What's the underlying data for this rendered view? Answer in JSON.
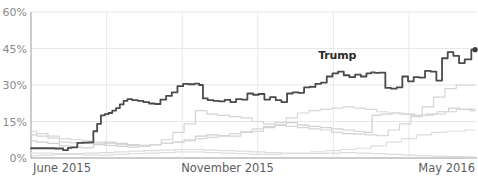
{
  "chart_data": {
    "type": "line",
    "title": "",
    "xlabel": "",
    "ylabel": "",
    "ylim": [
      0,
      60
    ],
    "yunit": "%",
    "grid": true,
    "legend_position": "inline-annotation",
    "ytick_labels": [
      "60%",
      "45%",
      "30%",
      "15%",
      "0%"
    ],
    "ytick_values": [
      60,
      45,
      30,
      15,
      0
    ],
    "xtick_labels": [
      "June 2015",
      "November 2015",
      "May 2016"
    ],
    "xtick_positions": [
      0,
      5.2,
      11.2
    ],
    "x_range_months": [
      0,
      11.8
    ],
    "annotations": [
      {
        "text": "Trump",
        "x_month": 8.1,
        "y_value": 40.5
      }
    ],
    "endpoint_marker": {
      "series": "Trump",
      "x_month": 11.75,
      "y_value": 44.5,
      "color": "#3d3d3d"
    },
    "colors": {
      "highlight_line": "#4a4a4a",
      "other_line": "#cfcfcf",
      "grid": "#e8e8e8",
      "axis": "#9a9a9a",
      "tick_text": "#8a8a8a",
      "xtick_text": "#5d5d5d",
      "background": "#ffffff"
    },
    "series": [
      {
        "name": "Trump",
        "highlight": true,
        "color": "#4a4a4a",
        "x": [
          0.0,
          0.25,
          0.5,
          0.75,
          0.95,
          1.0,
          1.15,
          1.3,
          1.45,
          1.6,
          1.7,
          1.8,
          1.9,
          2.0,
          2.1,
          2.2,
          2.3,
          2.4,
          2.5,
          2.6,
          2.75,
          2.9,
          3.05,
          3.2,
          3.35,
          3.5,
          3.65,
          3.8,
          3.95,
          4.1,
          4.25,
          4.4,
          4.5,
          4.6,
          4.75,
          4.9,
          5.05,
          5.2,
          5.35,
          5.5,
          5.65,
          5.8,
          5.95,
          6.1,
          6.25,
          6.4,
          6.55,
          6.7,
          6.85,
          7.0,
          7.15,
          7.3,
          7.45,
          7.6,
          7.75,
          7.9,
          8.05,
          8.2,
          8.35,
          8.5,
          8.65,
          8.8,
          8.95,
          9.05,
          9.15,
          9.3,
          9.45,
          9.6,
          9.75,
          9.9,
          10.05,
          10.2,
          10.35,
          10.5,
          10.65,
          10.8,
          10.95,
          11.1,
          11.25,
          11.4,
          11.55,
          11.75
        ],
        "y": [
          4.0,
          4.0,
          4.0,
          3.9,
          3.2,
          4.2,
          4.4,
          6.2,
          6.3,
          6.4,
          11.0,
          14.0,
          17.5,
          18.0,
          18.5,
          19.5,
          20.5,
          22.0,
          23.5,
          24.2,
          23.8,
          23.5,
          23.0,
          22.4,
          22.2,
          24.0,
          25.5,
          27.0,
          29.5,
          30.5,
          30.3,
          30.6,
          30.0,
          24.5,
          23.8,
          23.5,
          23.3,
          23.9,
          23.0,
          24.2,
          24.0,
          26.5,
          26.0,
          26.3,
          24.0,
          25.0,
          23.8,
          23.0,
          26.5,
          27.0,
          26.8,
          29.0,
          29.2,
          30.5,
          31.0,
          33.5,
          34.8,
          35.5,
          34.0,
          33.2,
          34.3,
          33.5,
          34.8,
          35.2,
          35.0,
          35.1,
          28.8,
          28.5,
          29.0,
          33.5,
          31.5,
          33.2,
          33.0,
          35.8,
          35.5,
          31.8,
          41.0,
          43.5,
          42.0,
          39.0,
          40.5,
          44.5
        ]
      },
      {
        "name": "other-1",
        "highlight": false,
        "color": "#d4d4d4",
        "x": [
          0.0,
          0.3,
          0.6,
          0.9,
          1.2,
          1.5,
          1.8,
          2.1,
          2.4,
          2.7,
          3.0,
          3.3,
          3.6,
          3.9,
          4.2,
          4.5,
          4.8,
          5.1,
          5.4,
          5.7,
          6.0,
          6.3,
          6.6,
          6.9,
          7.2,
          7.5,
          7.8,
          8.1,
          8.4,
          8.7,
          9.0,
          9.3,
          9.6,
          9.9,
          10.2,
          10.5,
          10.8,
          11.1,
          11.4,
          11.75
        ],
        "y": [
          9.5,
          9.0,
          8.2,
          6.5,
          6.2,
          6.0,
          5.8,
          5.2,
          4.8,
          4.5,
          4.8,
          5.5,
          7.5,
          10.5,
          14.0,
          19.5,
          18.0,
          17.5,
          17.0,
          16.5,
          15.0,
          14.0,
          13.5,
          13.0,
          12.5,
          12.0,
          11.5,
          10.5,
          10.0,
          9.8,
          9.5,
          9.2,
          11.5,
          14.0,
          17.0,
          21.0,
          25.0,
          28.5,
          30.0,
          30.0
        ]
      },
      {
        "name": "other-2",
        "highlight": false,
        "color": "#d0d0d0",
        "x": [
          0.0,
          0.3,
          0.6,
          0.9,
          1.2,
          1.5,
          1.8,
          2.1,
          2.4,
          2.7,
          3.0,
          3.3,
          3.6,
          3.9,
          4.2,
          4.5,
          4.8,
          5.1,
          5.4,
          5.7,
          6.0,
          6.3,
          6.6,
          6.9,
          7.2,
          7.5,
          7.8,
          8.1,
          8.4,
          8.7,
          8.95,
          9.1,
          9.4,
          9.7,
          10.0,
          10.3,
          10.6,
          10.9,
          11.2,
          11.5,
          11.75
        ],
        "y": [
          7.0,
          6.5,
          6.0,
          5.0,
          4.5,
          4.2,
          5.5,
          6.5,
          6.0,
          5.5,
          5.2,
          5.5,
          6.0,
          6.5,
          7.5,
          9.0,
          9.5,
          9.2,
          9.0,
          10.5,
          11.0,
          12.5,
          13.5,
          14.5,
          13.5,
          13.0,
          12.5,
          12.0,
          11.5,
          11.0,
          10.5,
          17.5,
          18.0,
          18.5,
          18.0,
          17.5,
          18.0,
          19.0,
          20.5,
          20.0,
          19.5
        ]
      },
      {
        "name": "other-3",
        "highlight": false,
        "color": "#d8d8d8",
        "x": [
          0.0,
          0.3,
          0.6,
          0.9,
          1.2,
          1.5,
          1.8,
          2.1,
          2.4,
          2.7,
          3.0,
          3.3,
          3.6,
          3.9,
          4.2,
          4.5,
          4.8,
          5.1,
          5.4,
          5.7,
          6.0,
          6.3,
          6.6,
          6.9,
          7.2,
          7.5,
          7.8,
          8.1,
          8.4,
          8.7,
          9.0,
          9.3,
          9.6,
          9.9,
          10.2,
          10.5,
          10.8,
          11.1,
          11.4,
          11.75
        ],
        "y": [
          11.0,
          10.0,
          9.0,
          8.0,
          7.5,
          7.0,
          6.5,
          6.0,
          5.5,
          5.2,
          5.0,
          5.5,
          6.0,
          6.5,
          7.0,
          8.0,
          8.5,
          9.0,
          10.0,
          11.0,
          12.0,
          13.0,
          14.5,
          16.5,
          18.5,
          19.5,
          20.0,
          20.5,
          21.0,
          20.5,
          20.0,
          19.0,
          18.5,
          18.0,
          17.5,
          17.5,
          18.0,
          19.0,
          20.0,
          20.2
        ]
      },
      {
        "name": "other-4",
        "highlight": false,
        "color": "#dcdcdc",
        "x": [
          0.0,
          0.4,
          0.8,
          1.2,
          1.6,
          2.0,
          2.4,
          2.8,
          3.2,
          3.6,
          4.0,
          4.4,
          4.8,
          5.2,
          5.6,
          6.0,
          6.4,
          6.8,
          7.2,
          7.6,
          8.0,
          8.4,
          8.8,
          9.2,
          9.6,
          10.0,
          10.4,
          10.8,
          11.2,
          11.75
        ],
        "y": [
          1.0,
          1.2,
          1.5,
          1.8,
          2.0,
          2.2,
          2.5,
          2.8,
          3.0,
          3.2,
          3.5,
          3.5,
          3.2,
          3.0,
          2.8,
          2.5,
          2.2,
          2.0,
          1.8,
          1.8,
          2.0,
          2.2,
          2.0,
          1.8,
          1.5,
          1.2,
          1.0,
          0.8,
          0.6,
          0.5
        ]
      },
      {
        "name": "other-5",
        "highlight": false,
        "color": "#dedede",
        "x": [
          0.0,
          0.4,
          0.8,
          1.2,
          1.6,
          2.0,
          2.4,
          2.8,
          3.2,
          3.6,
          4.0,
          4.4,
          4.8,
          5.2,
          5.6,
          6.0,
          6.4,
          6.8,
          7.2,
          7.6,
          8.0,
          8.4,
          8.8,
          9.2,
          9.6,
          10.0,
          10.4,
          10.8,
          11.2,
          11.75
        ],
        "y": [
          2.0,
          2.0,
          1.8,
          1.5,
          1.2,
          1.2,
          1.5,
          1.8,
          2.0,
          2.2,
          2.5,
          2.5,
          2.2,
          2.0,
          1.8,
          1.5,
          1.5,
          1.8,
          2.0,
          2.5,
          3.0,
          3.5,
          4.0,
          5.0,
          6.5,
          8.0,
          9.5,
          10.5,
          11.0,
          11.5
        ]
      }
    ]
  }
}
